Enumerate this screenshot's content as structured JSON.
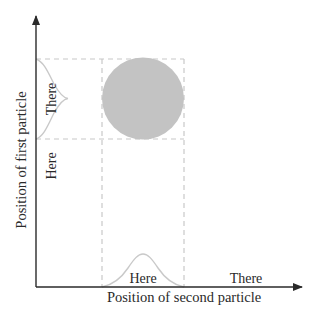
{
  "diagram": {
    "type": "probability-density-plot",
    "x_axis": {
      "title": "Position of second particle",
      "labels": [
        "Here",
        "There"
      ]
    },
    "y_axis": {
      "title": "Position of first particle",
      "labels": [
        "Here",
        "There"
      ]
    },
    "colors": {
      "axis": "#2a2a2a",
      "dashed_guides": "#c8c8c8",
      "density_blob": "#c3c3c3",
      "distribution_curve": "#c9c9c9",
      "text": "#2a2a2a"
    },
    "elements": {
      "blob": {
        "shape": "circle",
        "meaning": "joint probability region"
      },
      "left_curve": {
        "meaning": "first particle distribution",
        "peak_label": "There"
      },
      "bottom_curve": {
        "meaning": "second particle distribution",
        "peak_label": "Here"
      }
    }
  }
}
